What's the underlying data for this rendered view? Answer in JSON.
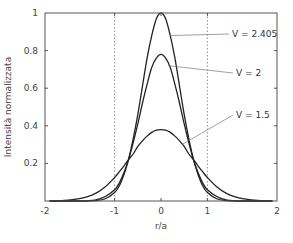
{
  "chart_data": {
    "type": "line",
    "title": "",
    "xlabel": "r/a",
    "ylabel": "Intensità normalizzata",
    "xlim": [
      -2.5,
      2.5
    ],
    "ylim": [
      0,
      1
    ],
    "grid": false,
    "x_ticks": [
      {
        "value": -2.5,
        "label": "-2"
      },
      {
        "value": -1,
        "label": "-1"
      },
      {
        "value": 0,
        "label": "0"
      },
      {
        "value": 1,
        "label": "1"
      },
      {
        "value": 2.5,
        "label": "2"
      }
    ],
    "y_ticks": [
      {
        "value": 0.2,
        "label": "0.2"
      },
      {
        "value": 0.4,
        "label": "0.4"
      },
      {
        "value": 0.6,
        "label": "0.6"
      },
      {
        "value": 0.8,
        "label": "0.8"
      },
      {
        "value": 1.0,
        "label": "1"
      }
    ],
    "reference_lines": [
      {
        "axis": "x",
        "value": -1,
        "style": "dotted"
      },
      {
        "axis": "x",
        "value": 1,
        "style": "dotted"
      }
    ],
    "series": [
      {
        "name": "V = 2.405",
        "x": [
          -2.4,
          -2.2,
          -2.0,
          -1.8,
          -1.6,
          -1.4,
          -1.2,
          -1.0,
          -0.9,
          -0.8,
          -0.7,
          -0.6,
          -0.5,
          -0.4,
          -0.3,
          -0.2,
          -0.1,
          0.0,
          0.1,
          0.2,
          0.3,
          0.4,
          0.5,
          0.6,
          0.7,
          0.8,
          0.9,
          1.0,
          1.2,
          1.4,
          1.6,
          1.8,
          2.0,
          2.2,
          2.4
        ],
        "values": [
          0.0,
          0.0,
          0.0,
          0.0,
          0.0,
          0.002,
          0.012,
          0.045,
          0.08,
          0.14,
          0.22,
          0.33,
          0.46,
          0.61,
          0.76,
          0.88,
          0.97,
          1.0,
          0.97,
          0.88,
          0.76,
          0.61,
          0.46,
          0.33,
          0.22,
          0.14,
          0.08,
          0.045,
          0.012,
          0.002,
          0.0,
          0.0,
          0.0,
          0.0,
          0.0
        ]
      },
      {
        "name": "V = 2",
        "x": [
          -2.4,
          -2.2,
          -2.0,
          -1.8,
          -1.6,
          -1.4,
          -1.2,
          -1.0,
          -0.9,
          -0.8,
          -0.7,
          -0.6,
          -0.5,
          -0.4,
          -0.3,
          -0.2,
          -0.1,
          0.0,
          0.1,
          0.2,
          0.3,
          0.4,
          0.5,
          0.6,
          0.7,
          0.8,
          0.9,
          1.0,
          1.2,
          1.4,
          1.6,
          1.8,
          2.0,
          2.2,
          2.4
        ],
        "values": [
          0.0,
          0.0,
          0.0,
          0.0,
          0.001,
          0.006,
          0.024,
          0.06,
          0.095,
          0.15,
          0.22,
          0.31,
          0.41,
          0.52,
          0.62,
          0.71,
          0.76,
          0.78,
          0.76,
          0.71,
          0.62,
          0.52,
          0.41,
          0.31,
          0.22,
          0.15,
          0.095,
          0.06,
          0.024,
          0.006,
          0.001,
          0.0,
          0.0,
          0.0,
          0.0
        ]
      },
      {
        "name": "V = 1.5",
        "x": [
          -2.4,
          -2.2,
          -2.0,
          -1.8,
          -1.6,
          -1.4,
          -1.2,
          -1.0,
          -0.9,
          -0.8,
          -0.7,
          -0.6,
          -0.5,
          -0.4,
          -0.3,
          -0.2,
          -0.1,
          0.0,
          0.1,
          0.2,
          0.3,
          0.4,
          0.5,
          0.6,
          0.7,
          0.8,
          0.9,
          1.0,
          1.2,
          1.4,
          1.6,
          1.8,
          2.0,
          2.2,
          2.4
        ],
        "values": [
          0.0,
          0.001,
          0.004,
          0.011,
          0.022,
          0.042,
          0.076,
          0.125,
          0.155,
          0.186,
          0.22,
          0.25,
          0.29,
          0.32,
          0.345,
          0.365,
          0.377,
          0.38,
          0.377,
          0.365,
          0.345,
          0.32,
          0.29,
          0.25,
          0.22,
          0.186,
          0.155,
          0.125,
          0.076,
          0.042,
          0.022,
          0.011,
          0.004,
          0.001,
          0.0
        ]
      }
    ],
    "annotations": [
      {
        "text": "V = 2.405",
        "points_to": {
          "x": 0.2,
          "y": 0.88
        }
      },
      {
        "text": "V = 2",
        "points_to": {
          "x": 0.15,
          "y": 0.72
        }
      },
      {
        "text": "V = 1.5",
        "points_to": {
          "x": 0.45,
          "y": 0.3
        }
      }
    ]
  }
}
